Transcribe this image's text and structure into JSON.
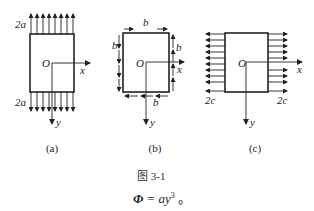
{
  "figure": {
    "caption": "图 3-1",
    "formula": {
      "lhs": "Φ",
      "eq": " = ay",
      "exp": "3",
      "tail": " 。"
    },
    "subfigures": [
      {
        "id": "a",
        "label": "(a)",
        "origin_label": "O",
        "x_axis_label": "x",
        "y_axis_label": "y",
        "top_load_label": "2a",
        "bottom_load_label": "2a",
        "load_type": "uniform normal tension on top and bottom edges"
      },
      {
        "id": "b",
        "label": "(b)",
        "origin_label": "O",
        "x_axis_label": "x",
        "y_axis_label": "y",
        "top_load_label": "b",
        "bottom_load_label": "b",
        "left_load_label": "b",
        "right_load_label": "b",
        "load_type": "uniform shear on all four edges"
      },
      {
        "id": "c",
        "label": "(c)",
        "origin_label": "O",
        "x_axis_label": "x",
        "y_axis_label": "y",
        "left_load_label": "2c",
        "right_load_label": "2c",
        "load_type": "uniform normal tension on left and right edges"
      }
    ]
  },
  "colors": {
    "ink": "#222222",
    "background": "#ffffff"
  }
}
